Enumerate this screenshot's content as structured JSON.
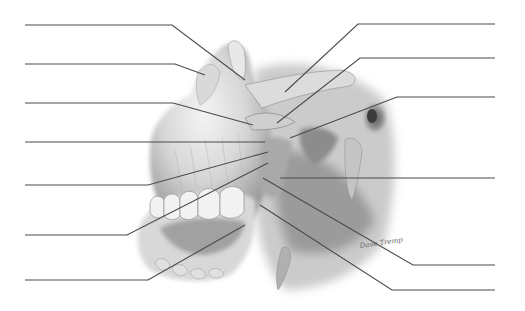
{
  "diagram": {
    "title": "",
    "artist_signature": "Dave Tremp",
    "colors": {
      "background": "#ffffff",
      "leader_line": "#4a4a4a",
      "bone_light": "#ececec",
      "bone_mid": "#bdbdbd",
      "bone_dark": "#6e6e6e",
      "shadow": "#3c3c3c"
    },
    "labels_left": [
      {
        "id": "L1",
        "text": "",
        "line_y": 25,
        "points": [
          [
            25,
            25
          ],
          [
            172,
            25
          ],
          [
            245,
            80
          ]
        ]
      },
      {
        "id": "L2",
        "text": "",
        "line_y": 64,
        "points": [
          [
            25,
            64
          ],
          [
            175,
            64
          ],
          [
            205,
            75
          ]
        ]
      },
      {
        "id": "L3",
        "text": "",
        "line_y": 103,
        "points": [
          [
            25,
            103
          ],
          [
            173,
            103
          ],
          [
            253,
            125
          ]
        ]
      },
      {
        "id": "L4",
        "text": "",
        "line_y": 142,
        "points": [
          [
            25,
            142
          ],
          [
            265,
            142
          ]
        ]
      },
      {
        "id": "L5",
        "text": "",
        "line_y": 185,
        "points": [
          [
            25,
            185
          ],
          [
            148,
            185
          ],
          [
            268,
            152
          ]
        ]
      },
      {
        "id": "L6",
        "text": "",
        "line_y": 235,
        "points": [
          [
            25,
            235
          ],
          [
            127,
            235
          ],
          [
            268,
            163
          ]
        ]
      },
      {
        "id": "L7",
        "text": "",
        "line_y": 280,
        "points": [
          [
            25,
            280
          ],
          [
            148,
            280
          ],
          [
            245,
            225
          ]
        ]
      }
    ],
    "labels_right": [
      {
        "id": "R1",
        "text": "",
        "line_y": 24,
        "points": [
          [
            495,
            24
          ],
          [
            358,
            24
          ],
          [
            285,
            92
          ]
        ]
      },
      {
        "id": "R2",
        "text": "",
        "line_y": 58,
        "points": [
          [
            495,
            58
          ],
          [
            360,
            58
          ],
          [
            277,
            123
          ]
        ]
      },
      {
        "id": "R3",
        "text": "",
        "line_y": 97,
        "points": [
          [
            495,
            97
          ],
          [
            397,
            97
          ],
          [
            290,
            138
          ]
        ]
      },
      {
        "id": "R4",
        "text": "",
        "line_y": 178,
        "points": [
          [
            495,
            178
          ],
          [
            280,
            178
          ]
        ]
      },
      {
        "id": "R5",
        "text": "",
        "line_y": 265,
        "points": [
          [
            495,
            265
          ],
          [
            413,
            265
          ],
          [
            263,
            178
          ]
        ]
      },
      {
        "id": "R6",
        "text": "",
        "line_y": 290,
        "points": [
          [
            495,
            290
          ],
          [
            392,
            290
          ],
          [
            260,
            205
          ]
        ]
      }
    ]
  }
}
